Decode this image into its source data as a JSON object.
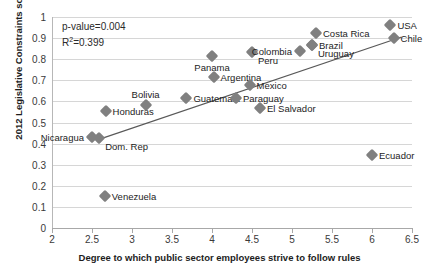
{
  "chart_data": {
    "type": "scatter",
    "title": "",
    "xlabel": "Degree to which public sector employees strive to follow rules",
    "ylabel": "2012 Legislative Constraints score",
    "xlim": [
      2,
      6.5
    ],
    "ylim": [
      0,
      1
    ],
    "xticks": [
      "2",
      "2.5",
      "3",
      "3.5",
      "4",
      "4.5",
      "5",
      "5.5",
      "6",
      "6.5"
    ],
    "xtick_values": [
      2,
      2.5,
      3,
      3.5,
      4,
      4.5,
      5,
      5.5,
      6,
      6.5
    ],
    "yticks": [
      "0",
      "0.1",
      "0.2",
      "0.3",
      "0.4",
      "0.5",
      "0.6",
      "0.7",
      "0.8",
      "0.9",
      "1"
    ],
    "ytick_values": [
      0,
      0.1,
      0.2,
      0.3,
      0.4,
      0.5,
      0.6,
      0.7,
      0.8,
      0.9,
      1
    ],
    "grid": true,
    "legend": "none",
    "marker_color": "#808080",
    "trendline_color": "#595959",
    "trendline": {
      "x0": 2.55,
      "y0": 0.415,
      "x1": 6.37,
      "y1": 0.905
    },
    "annotations": {
      "p_value": "p-value=0.004",
      "r_squared_prefix": "R",
      "r_squared_sup": "2",
      "r_squared_value": "=0.399"
    },
    "points": [
      {
        "label": "Nicaragua",
        "x": 2.5,
        "y": 0.43,
        "label_pos": "left"
      },
      {
        "label": "Dom. Rep",
        "x": 2.59,
        "y": 0.425,
        "label_pos": "below-right"
      },
      {
        "label": "Venezuela",
        "x": 2.66,
        "y": 0.15,
        "label_pos": "right"
      },
      {
        "label": "Honduras",
        "x": 2.67,
        "y": 0.555,
        "label_pos": "right"
      },
      {
        "label": "Bolivia",
        "x": 3.17,
        "y": 0.585,
        "label_pos": "above"
      },
      {
        "label": "Guatemala",
        "x": 3.68,
        "y": 0.615,
        "label_pos": "right"
      },
      {
        "label": "Panama",
        "x": 4.0,
        "y": 0.815,
        "label_pos": "below"
      },
      {
        "label": "Argentina",
        "x": 4.02,
        "y": 0.715,
        "label_pos": "right"
      },
      {
        "label": "Peru",
        "x": 4.5,
        "y": 0.835,
        "label_pos": "below-right"
      },
      {
        "label": "Paraguay",
        "x": 4.3,
        "y": 0.615,
        "label_pos": "right"
      },
      {
        "label": "Mexico",
        "x": 4.47,
        "y": 0.68,
        "label_pos": "right"
      },
      {
        "label": "El Salvador",
        "x": 4.6,
        "y": 0.57,
        "label_pos": "right"
      },
      {
        "label": "Colombia",
        "x": 5.1,
        "y": 0.84,
        "label_pos": "left"
      },
      {
        "label": "Uruguay",
        "x": 5.25,
        "y": 0.865,
        "label_pos": "below-right"
      },
      {
        "label": "Brazil",
        "x": 5.25,
        "y": 0.865,
        "label_pos": "right"
      },
      {
        "label": "Costa Rica",
        "x": 5.3,
        "y": 0.925,
        "label_pos": "right"
      },
      {
        "label": "Ecuador",
        "x": 6.0,
        "y": 0.345,
        "label_pos": "right"
      },
      {
        "label": "USA",
        "x": 6.23,
        "y": 0.96,
        "label_pos": "right"
      },
      {
        "label": "Chile",
        "x": 6.27,
        "y": 0.9,
        "label_pos": "right"
      }
    ]
  }
}
